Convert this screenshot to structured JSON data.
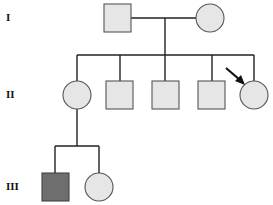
{
  "diagram": {
    "type": "pedigree",
    "generations": [
      {
        "label": "I",
        "y": 18
      },
      {
        "label": "II",
        "y": 95
      },
      {
        "label": "III",
        "y": 187
      }
    ],
    "colors": {
      "line": "#222222",
      "unaffected_fill": "#e6e6e6",
      "affected_fill": "#6e6e6e",
      "arrow": "#111111"
    },
    "individuals": [
      {
        "id": "I-1",
        "sex": "male",
        "affected": false,
        "x": 117,
        "y": 18
      },
      {
        "id": "I-2",
        "sex": "female",
        "affected": false,
        "x": 210,
        "y": 18
      },
      {
        "id": "II-1",
        "sex": "female",
        "affected": false,
        "x": 77,
        "y": 95
      },
      {
        "id": "II-2",
        "sex": "male",
        "affected": false,
        "x": 120,
        "y": 95
      },
      {
        "id": "II-3",
        "sex": "male",
        "affected": false,
        "x": 165,
        "y": 95
      },
      {
        "id": "II-4",
        "sex": "male",
        "affected": false,
        "x": 212,
        "y": 95
      },
      {
        "id": "II-5",
        "sex": "female",
        "affected": false,
        "proband": true,
        "x": 254,
        "y": 95
      },
      {
        "id": "III-1",
        "sex": "male",
        "affected": true,
        "x": 55,
        "y": 187
      },
      {
        "id": "III-2",
        "sex": "female",
        "affected": false,
        "x": 99,
        "y": 187
      }
    ]
  }
}
